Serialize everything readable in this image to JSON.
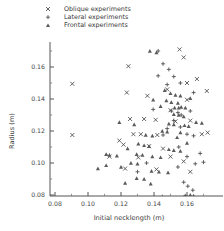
{
  "chart_data": {
    "type": "scatter",
    "title": "",
    "xlabel": "Initial necklength (m)",
    "ylabel": "Radius (m)",
    "xlim": [
      0.07,
      0.175
    ],
    "ylim": [
      0.07,
      0.175
    ],
    "xticks": [
      0.08,
      0.1,
      0.12,
      0.14,
      0.16
    ],
    "xticklabels": [
      "0.08",
      "0.10",
      "0.12",
      "0.14",
      "0.16"
    ],
    "yticks": [
      0.08,
      0.1,
      0.12,
      0.14,
      0.16
    ],
    "yticklabels": [
      "0.08",
      "0.10",
      "0.12",
      "0.14",
      "0.16"
    ],
    "grid": false,
    "legend_position": "top-center",
    "legend": [
      {
        "label": "Oblique experiments",
        "marker": "x"
      },
      {
        "label": "Lateral experiments",
        "marker": "+"
      },
      {
        "label": "Frontal experiments",
        "marker": "triangle"
      }
    ],
    "series": [
      {
        "name": "Oblique experiments",
        "marker": "x",
        "points": [
          [
            0.0905,
            0.1495
          ],
          [
            0.0905,
            0.1175
          ],
          [
            0.1245,
            0.1605
          ],
          [
            0.1555,
            0.171
          ],
          [
            0.158,
            0.166
          ],
          [
            0.148,
            0.146
          ],
          [
            0.16,
            0.1395
          ],
          [
            0.172,
            0.145
          ],
          [
            0.1255,
            0.1275
          ],
          [
            0.134,
            0.1275
          ],
          [
            0.141,
            0.127
          ],
          [
            0.1275,
            0.118
          ],
          [
            0.132,
            0.118
          ],
          [
            0.142,
            0.1175
          ],
          [
            0.119,
            0.114
          ],
          [
            0.1215,
            0.1115
          ],
          [
            0.137,
            0.1105
          ],
          [
            0.1455,
            0.109
          ],
          [
            0.153,
            0.126
          ],
          [
            0.162,
            0.1265
          ],
          [
            0.169,
            0.118
          ],
          [
            0.1725,
            0.119
          ],
          [
            0.113,
            0.104
          ],
          [
            0.1305,
            0.1035
          ],
          [
            0.15,
            0.104
          ],
          [
            0.158,
            0.101
          ],
          [
            0.1415,
            0.096
          ],
          [
            0.1225,
            0.0965
          ],
          [
            0.162,
            0.0945
          ],
          [
            0.15,
            0.133
          ],
          [
            0.16,
            0.15
          ],
          [
            0.166,
            0.1525
          ],
          [
            0.136,
            0.142
          ],
          [
            0.1235,
            0.144
          ]
        ]
      },
      {
        "name": "Lateral experiments",
        "marker": "+",
        "points": [
          [
            0.1425,
            0.17
          ],
          [
            0.1455,
            0.162
          ],
          [
            0.149,
            0.1585
          ],
          [
            0.152,
            0.154
          ],
          [
            0.156,
            0.15
          ],
          [
            0.148,
            0.149
          ],
          [
            0.1425,
            0.1545
          ],
          [
            0.1395,
            0.1335
          ],
          [
            0.1505,
            0.1325
          ],
          [
            0.1545,
            0.1315
          ],
          [
            0.1565,
            0.13
          ],
          [
            0.152,
            0.1265
          ],
          [
            0.156,
            0.1225
          ],
          [
            0.162,
            0.1325
          ],
          [
            0.164,
            0.144
          ],
          [
            0.16,
            0.118
          ],
          [
            0.164,
            0.117
          ],
          [
            0.155,
            0.11
          ],
          [
            0.16,
            0.104
          ],
          [
            0.165,
            0.0995
          ],
          [
            0.1545,
            0.0975
          ],
          [
            0.158,
            0.088
          ],
          [
            0.1605,
            0.0855
          ],
          [
            0.1635,
            0.083
          ],
          [
            0.159,
            0.0795
          ],
          [
            0.162,
            0.079
          ],
          [
            0.145,
            0.079
          ],
          [
            0.1355,
            0.1
          ],
          [
            0.13,
            0.0945
          ],
          [
            0.1455,
            0.1175
          ],
          [
            0.148,
            0.1215
          ],
          [
            0.168,
            0.106
          ],
          [
            0.17,
            0.1005
          ]
        ]
      },
      {
        "name": "Frontal experiments",
        "marker": "triangle",
        "points": [
          [
            0.1375,
            0.17
          ],
          [
            0.1415,
            0.169
          ],
          [
            0.15,
            0.1435
          ],
          [
            0.153,
            0.1425
          ],
          [
            0.156,
            0.142
          ],
          [
            0.1475,
            0.139
          ],
          [
            0.1505,
            0.138
          ],
          [
            0.1545,
            0.1375
          ],
          [
            0.1395,
            0.1395
          ],
          [
            0.144,
            0.1355
          ],
          [
            0.1525,
            0.1345
          ],
          [
            0.155,
            0.1345
          ],
          [
            0.1565,
            0.135
          ],
          [
            0.159,
            0.1345
          ],
          [
            0.152,
            0.1305
          ],
          [
            0.155,
            0.13
          ],
          [
            0.158,
            0.129
          ],
          [
            0.149,
            0.1245
          ],
          [
            0.152,
            0.124
          ],
          [
            0.1585,
            0.1235
          ],
          [
            0.161,
            0.123
          ],
          [
            0.145,
            0.12
          ],
          [
            0.148,
            0.1195
          ],
          [
            0.156,
            0.119
          ],
          [
            0.135,
            0.1175
          ],
          [
            0.139,
            0.117
          ],
          [
            0.1305,
            0.112
          ],
          [
            0.134,
            0.111
          ],
          [
            0.137,
            0.1105
          ],
          [
            0.124,
            0.109
          ],
          [
            0.149,
            0.1085
          ],
          [
            0.152,
            0.108
          ],
          [
            0.156,
            0.1075
          ],
          [
            0.1295,
            0.1055
          ],
          [
            0.133,
            0.105
          ],
          [
            0.1175,
            0.1045
          ],
          [
            0.111,
            0.1055
          ],
          [
            0.113,
            0.105
          ],
          [
            0.139,
            0.104
          ],
          [
            0.144,
            0.1035
          ],
          [
            0.126,
            0.1
          ],
          [
            0.13,
            0.0995
          ],
          [
            0.12,
            0.0975
          ],
          [
            0.111,
            0.0985
          ],
          [
            0.106,
            0.0965
          ],
          [
            0.1385,
            0.095
          ],
          [
            0.143,
            0.0945
          ],
          [
            0.1485,
            0.094
          ],
          [
            0.1295,
            0.0905
          ],
          [
            0.134,
            0.09
          ],
          [
            0.1225,
            0.0875
          ],
          [
            0.138,
            0.087
          ],
          [
            0.1585,
            0.079
          ],
          [
            0.1605,
            0.0785
          ],
          [
            0.162,
            0.08
          ],
          [
            0.164,
            0.0795
          ],
          [
            0.1465,
            0.1455
          ],
          [
            0.162,
            0.1405
          ],
          [
            0.1655,
            0.1255
          ],
          [
            0.169,
            0.125
          ],
          [
            0.154,
            0.116
          ],
          [
            0.16,
            0.1125
          ],
          [
            0.128,
            0.124
          ],
          [
            0.119,
            0.1255
          ]
        ]
      }
    ]
  },
  "legend_items": {
    "oblique": "Oblique experiments",
    "lateral": "Lateral experiments",
    "frontal": "Frontal experiments"
  },
  "axes": {
    "x_title": "Initial necklength (m)",
    "y_title": "Radius (m)"
  }
}
